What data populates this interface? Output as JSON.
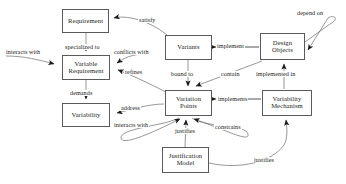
{
  "diagram": {
    "type": "entity-relationship-diagram",
    "colors": {
      "box_border": "#5a5a5a",
      "box_fill": "#ffffff",
      "edge": "#6b6b6b",
      "text": "#1a1a1a",
      "background": "#ffffff"
    },
    "nodes": [
      {
        "id": "requirement",
        "label": "Requirement",
        "x": 62,
        "y": 9,
        "w": 47,
        "h": 24
      },
      {
        "id": "variable-requirement",
        "label": "Variable\nRequirement",
        "x": 62,
        "y": 55,
        "w": 48,
        "h": 25
      },
      {
        "id": "variability",
        "label": "Variability",
        "x": 62,
        "y": 103,
        "w": 48,
        "h": 24
      },
      {
        "id": "variants",
        "label": "Variants",
        "x": 165,
        "y": 35,
        "w": 47,
        "h": 25
      },
      {
        "id": "variation-points",
        "label": "Variation\nPoints",
        "x": 165,
        "y": 90,
        "w": 47,
        "h": 26
      },
      {
        "id": "design-objects",
        "label": "Design\nObjects",
        "x": 260,
        "y": 33,
        "w": 45,
        "h": 27
      },
      {
        "id": "variability-mechanism",
        "label": "Variability\nMechanism",
        "x": 262,
        "y": 90,
        "w": 50,
        "h": 26
      },
      {
        "id": "justification-model",
        "label": "Justification\nModel",
        "x": 162,
        "y": 147,
        "w": 47,
        "h": 26
      }
    ],
    "edges": [
      {
        "id": "satisfy",
        "label": "satisfy",
        "from": "variants",
        "to": "requirement",
        "label_x": 138,
        "label_y": 17
      },
      {
        "id": "specialized-to",
        "label": "specialized to",
        "from": "requirement",
        "to": "variable-requirement",
        "label_x": 64,
        "label_y": 44
      },
      {
        "id": "interacts-with-1",
        "label": "interacts with",
        "from": "variable-requirement",
        "to": "variable-requirement",
        "label_x": 5,
        "label_y": 49
      },
      {
        "id": "conflicts-with",
        "label": "conflicts with",
        "from": "variable-requirement",
        "to": "variable-requirement",
        "label_x": 113,
        "label_y": 49
      },
      {
        "id": "refines",
        "label": "refines",
        "from": "variation-points",
        "to": "variable-requirement",
        "label_x": 124,
        "label_y": 69
      },
      {
        "id": "demands",
        "label": "demands",
        "from": "variable-requirement",
        "to": "variability",
        "label_x": 69,
        "label_y": 90
      },
      {
        "id": "address",
        "label": "address",
        "from": "variation-points",
        "to": "variability",
        "label_x": 120,
        "label_y": 105
      },
      {
        "id": "interacts-with-2",
        "label": "interacts with",
        "from": "variation-points",
        "to": "variation-points",
        "label_x": 113,
        "label_y": 122
      },
      {
        "id": "implement",
        "label": "implement",
        "from": "design-objects",
        "to": "variants",
        "label_x": 216,
        "label_y": 45
      },
      {
        "id": "depend-on",
        "label": "depend on",
        "from": "design-objects",
        "to": "design-objects",
        "label_x": 296,
        "label_y": 10
      },
      {
        "id": "bound-to",
        "label": "bound to",
        "from": "variants",
        "to": "variation-points",
        "label_x": 170,
        "label_y": 73
      },
      {
        "id": "contain",
        "label": "contain",
        "from": "design-objects",
        "to": "variation-points",
        "label_x": 220,
        "label_y": 73
      },
      {
        "id": "implemented-in",
        "label": "implemented in",
        "from": "variability-mechanism",
        "to": "design-objects",
        "label_x": 257,
        "label_y": 73
      },
      {
        "id": "implements",
        "label": "implements",
        "from": "variability-mechanism",
        "to": "variation-points",
        "label_x": 218,
        "label_y": 100
      },
      {
        "id": "constrains",
        "label": "constrains",
        "from": "variation-points",
        "to": "variation-points",
        "label_x": 214,
        "label_y": 124
      },
      {
        "id": "justifies-vp",
        "label": "justifies",
        "from": "justification-model",
        "to": "variation-points",
        "label_x": 174,
        "label_y": 128
      },
      {
        "id": "justifies-vm",
        "label": "justifies",
        "from": "justification-model",
        "to": "variability-mechanism",
        "label_x": 253,
        "label_y": 159
      }
    ]
  }
}
